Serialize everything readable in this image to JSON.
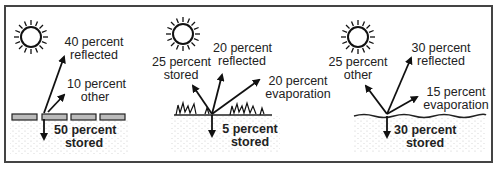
{
  "panels": [
    {
      "surface": "pavement",
      "labels": {
        "reflected": [
          "40 percent",
          "reflected"
        ],
        "other": [
          "10 percent",
          "other"
        ],
        "stored": [
          "50 percent",
          "stored"
        ]
      }
    },
    {
      "surface": "grass",
      "labels": {
        "stored_up": [
          "25 percent",
          "stored"
        ],
        "reflected": [
          "20 percent",
          "reflected"
        ],
        "evaporation": [
          "20 percent",
          "evaporation"
        ],
        "stored": [
          "5 percent",
          "stored"
        ]
      }
    },
    {
      "surface": "water",
      "labels": {
        "other": [
          "25 percent",
          "other"
        ],
        "reflected": [
          "30 percent",
          "reflected"
        ],
        "evaporation": [
          "15 percent",
          "evaporation"
        ],
        "stored": [
          "30 percent",
          "stored"
        ]
      }
    }
  ]
}
